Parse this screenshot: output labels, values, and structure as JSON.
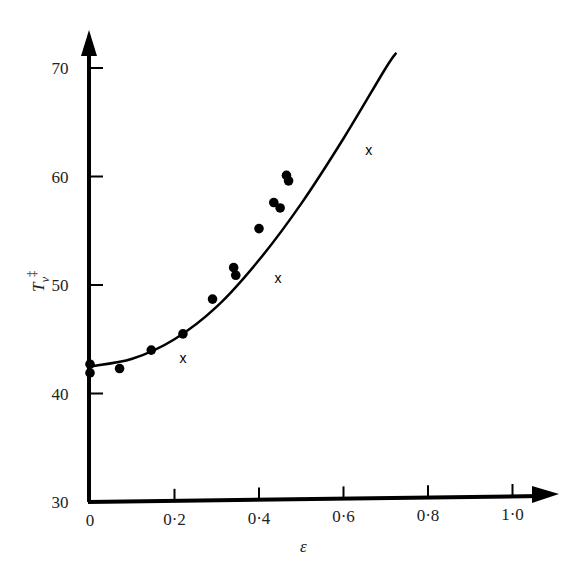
{
  "chart_data": {
    "type": "scatter",
    "title": "",
    "xlabel": "ε",
    "ylabel": "T_v‡",
    "ylabel_main": "T",
    "ylabel_sub": "v",
    "ylabel_sup": "‡",
    "xlim": [
      0,
      1.0
    ],
    "ylim": [
      30,
      70
    ],
    "grid": false,
    "legend": "none",
    "x_ticks": [
      "0",
      "0·2",
      "0·4",
      "0·6",
      "0·8",
      "1·0"
    ],
    "x_tick_values": [
      0,
      0.2,
      0.4,
      0.6,
      0.8,
      1.0
    ],
    "y_ticks": [
      "30",
      "40",
      "50",
      "60",
      "70"
    ],
    "y_tick_values": [
      30,
      40,
      50,
      60,
      70
    ],
    "series": [
      {
        "name": "dots",
        "marker": "filled-circle",
        "points": [
          [
            0.0,
            42.7
          ],
          [
            0.0,
            41.9
          ],
          [
            0.07,
            42.3
          ],
          [
            0.145,
            44.0
          ],
          [
            0.22,
            45.5
          ],
          [
            0.29,
            48.7
          ],
          [
            0.34,
            51.6
          ],
          [
            0.345,
            50.9
          ],
          [
            0.4,
            55.2
          ],
          [
            0.435,
            57.6
          ],
          [
            0.45,
            57.1
          ],
          [
            0.465,
            60.1
          ],
          [
            0.47,
            59.6
          ]
        ]
      },
      {
        "name": "crosses",
        "marker": "x",
        "points": [
          [
            0.22,
            43.3
          ],
          [
            0.445,
            50.6
          ],
          [
            0.66,
            62.4
          ]
        ]
      },
      {
        "name": "fitted curve",
        "type": "line",
        "points": [
          [
            0.0,
            42.5
          ],
          [
            0.1,
            43.2
          ],
          [
            0.2,
            45.0
          ],
          [
            0.3,
            48.0
          ],
          [
            0.4,
            52.3
          ],
          [
            0.5,
            57.5
          ],
          [
            0.6,
            63.5
          ],
          [
            0.7,
            70.0
          ],
          [
            0.725,
            71.4
          ]
        ]
      }
    ]
  }
}
